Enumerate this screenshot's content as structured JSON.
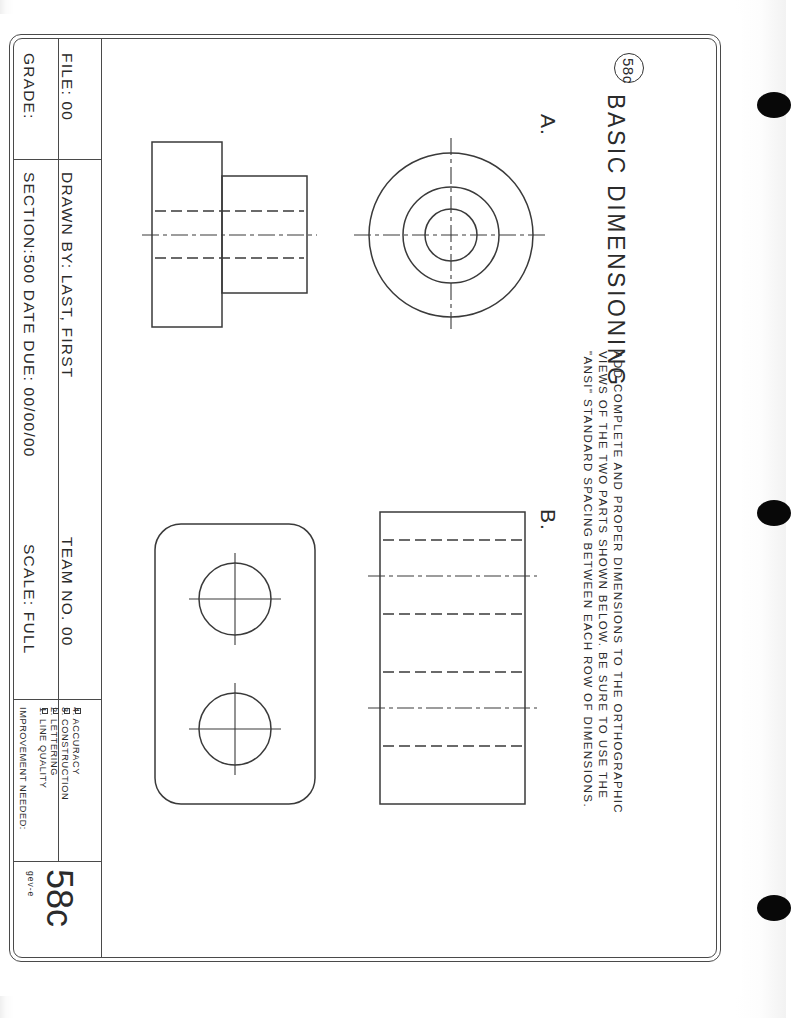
{
  "sheet": {
    "badge_number": "58c",
    "title": "BASIC DIMENSIONING",
    "instructions_line1": "ADD COMPLETE AND PROPER DIMENSIONS TO THE ORTHOGRAPHIC",
    "instructions_line2": "VIEWS OF THE TWO PARTS SHOWN BELOW.   BE SURE TO USE THE",
    "instructions_line3": "\"ANSI\" STANDARD SPACING BETWEEN EACH ROW OF DIMENSIONS.",
    "part_a_label": "A.",
    "part_b_label": "B.",
    "sheet_number": "58c",
    "sheet_code": "gev-e"
  },
  "title_block": {
    "file_label": "FILE:",
    "file_value": "00",
    "grade_label": "GRADE:",
    "drawn_by_label": "DRAWN BY:",
    "drawn_by_value": "LAST, FIRST",
    "team_no_label": "TEAM NO.",
    "team_no_value": "00",
    "section_label": "SECTION:",
    "section_value": "500",
    "date_due_label": "DATE DUE:",
    "date_due_value": "00/00/00",
    "scale_label": "SCALE:",
    "scale_value": "FULL",
    "row1_combined": "FILE:  00",
    "row2_combined": "DRAWN BY:  LAST, FIRST",
    "row3_combined": "TEAM NO.  00",
    "grade_combined": "GRADE:",
    "section_combined": "SECTION:500  DATE DUE:  00/00/00",
    "scale_combined": "SCALE:  FULL"
  },
  "improvement": {
    "heading": "IMPROVEMENT NEEDED:",
    "items": [
      {
        "num": "1.",
        "label": "LINE QUALITY"
      },
      {
        "num": "2.",
        "label": "LETTERING"
      },
      {
        "num": "3.",
        "label": "CONSTRUCTION"
      },
      {
        "num": "4.",
        "label": "ACCURACY"
      }
    ],
    "item1": "1.  LINE QUALITY",
    "item2": "2.  LETTERING",
    "item3": "3.  CONSTRUCTION",
    "item4": "4.  ACCURACY"
  },
  "colors": {
    "line": "#3a3a3a",
    "text": "#2b2b2b",
    "paper": "#ffffff",
    "hole": "#080808"
  }
}
